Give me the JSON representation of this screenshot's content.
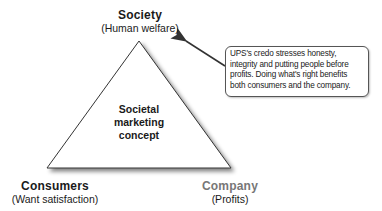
{
  "diagram": {
    "center_label": [
      "Societal",
      "marketing",
      "concept"
    ],
    "vertices": {
      "top": {
        "title": "Society",
        "subtitle": "(Human welfare)"
      },
      "left": {
        "title": "Consumers",
        "subtitle": "(Want satisfaction)"
      },
      "right": {
        "title": "Company",
        "subtitle": "(Profits)"
      }
    },
    "callout": {
      "text": "UPS's credo stresses honesty, integrity and putting people before profits. Doing what's right benefits both consumers and the company."
    },
    "colors": {
      "stroke": "#333333",
      "company_title": "#777777",
      "text": "#1a1a1a"
    }
  }
}
